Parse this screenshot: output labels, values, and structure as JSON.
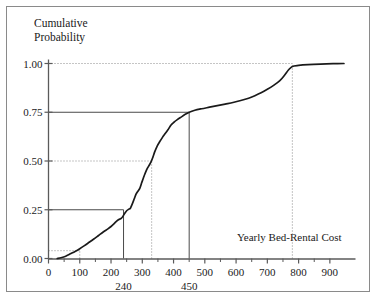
{
  "chart_data": {
    "type": "line",
    "title": "",
    "ylabel": "Cumulative\nProbability",
    "ylabel_line1": "Cumulative",
    "ylabel_line2": "Probability",
    "xlabel": "Yearly Bed-Rental Cost",
    "xlim": [
      0,
      950
    ],
    "ylim": [
      0.0,
      1.0
    ],
    "grid": false,
    "legend": null,
    "y_ticks": [
      {
        "value": 1.0,
        "label": "1.00"
      },
      {
        "value": 0.75,
        "label": "0.75"
      },
      {
        "value": 0.5,
        "label": "0.50"
      },
      {
        "value": 0.25,
        "label": "0.25"
      },
      {
        "value": 0.0,
        "label": "0.00"
      }
    ],
    "x_ticks": [
      {
        "value": 0,
        "label": "0"
      },
      {
        "value": 100,
        "label": "100"
      },
      {
        "value": 200,
        "label": "200"
      },
      {
        "value": 300,
        "label": "300"
      },
      {
        "value": 400,
        "label": "400"
      },
      {
        "value": 500,
        "label": "500"
      },
      {
        "value": 600,
        "label": "600"
      },
      {
        "value": 700,
        "label": "700"
      },
      {
        "value": 800,
        "label": "800"
      },
      {
        "value": 900,
        "label": "900"
      }
    ],
    "x_minor_ticks": [
      50,
      150,
      250,
      350,
      450,
      550,
      650,
      750,
      850
    ],
    "x_annotations": [
      {
        "value": 240,
        "label": "240"
      },
      {
        "value": 450,
        "label": "450"
      }
    ],
    "reference_lines": [
      {
        "name": "p25",
        "x": 240,
        "y": 0.25,
        "style": "solid",
        "color": "#4a4a4a"
      },
      {
        "name": "p50",
        "x": 330,
        "y": 0.5,
        "style": "dotted",
        "color": "#8a8a8a"
      },
      {
        "name": "p75",
        "x": 450,
        "y": 0.75,
        "style": "solid",
        "color": "#4a4a4a"
      },
      {
        "name": "p100",
        "x": 780,
        "y": 1.0,
        "style": "dotted",
        "color": "#8a8a8a"
      },
      {
        "name": "p_min",
        "x": 100,
        "y": 0.04,
        "style": "dotted",
        "color": "#8a8a8a"
      }
    ],
    "curve_color": "#1a1a1a",
    "axis_color": "#5a5a5a",
    "points": [
      {
        "x": 28,
        "y": 0.0
      },
      {
        "x": 40,
        "y": 0.004
      },
      {
        "x": 55,
        "y": 0.012
      },
      {
        "x": 70,
        "y": 0.024
      },
      {
        "x": 85,
        "y": 0.036
      },
      {
        "x": 100,
        "y": 0.05
      },
      {
        "x": 115,
        "y": 0.066
      },
      {
        "x": 130,
        "y": 0.083
      },
      {
        "x": 145,
        "y": 0.1
      },
      {
        "x": 160,
        "y": 0.118
      },
      {
        "x": 175,
        "y": 0.136
      },
      {
        "x": 190,
        "y": 0.152
      },
      {
        "x": 200,
        "y": 0.164
      },
      {
        "x": 210,
        "y": 0.179
      },
      {
        "x": 218,
        "y": 0.192
      },
      {
        "x": 225,
        "y": 0.2
      },
      {
        "x": 232,
        "y": 0.205
      },
      {
        "x": 238,
        "y": 0.216
      },
      {
        "x": 244,
        "y": 0.232
      },
      {
        "x": 250,
        "y": 0.245
      },
      {
        "x": 256,
        "y": 0.252
      },
      {
        "x": 262,
        "y": 0.258
      },
      {
        "x": 268,
        "y": 0.28
      },
      {
        "x": 274,
        "y": 0.305
      },
      {
        "x": 280,
        "y": 0.33
      },
      {
        "x": 286,
        "y": 0.345
      },
      {
        "x": 292,
        "y": 0.36
      },
      {
        "x": 298,
        "y": 0.388
      },
      {
        "x": 304,
        "y": 0.415
      },
      {
        "x": 310,
        "y": 0.44
      },
      {
        "x": 316,
        "y": 0.462
      },
      {
        "x": 322,
        "y": 0.478
      },
      {
        "x": 328,
        "y": 0.495
      },
      {
        "x": 334,
        "y": 0.52
      },
      {
        "x": 340,
        "y": 0.548
      },
      {
        "x": 348,
        "y": 0.578
      },
      {
        "x": 356,
        "y": 0.6
      },
      {
        "x": 364,
        "y": 0.62
      },
      {
        "x": 372,
        "y": 0.638
      },
      {
        "x": 382,
        "y": 0.66
      },
      {
        "x": 392,
        "y": 0.685
      },
      {
        "x": 402,
        "y": 0.7
      },
      {
        "x": 412,
        "y": 0.712
      },
      {
        "x": 424,
        "y": 0.725
      },
      {
        "x": 436,
        "y": 0.738
      },
      {
        "x": 450,
        "y": 0.75
      },
      {
        "x": 468,
        "y": 0.76
      },
      {
        "x": 490,
        "y": 0.768
      },
      {
        "x": 515,
        "y": 0.776
      },
      {
        "x": 540,
        "y": 0.784
      },
      {
        "x": 565,
        "y": 0.792
      },
      {
        "x": 590,
        "y": 0.8
      },
      {
        "x": 615,
        "y": 0.81
      },
      {
        "x": 640,
        "y": 0.822
      },
      {
        "x": 660,
        "y": 0.835
      },
      {
        "x": 680,
        "y": 0.85
      },
      {
        "x": 700,
        "y": 0.868
      },
      {
        "x": 720,
        "y": 0.888
      },
      {
        "x": 740,
        "y": 0.912
      },
      {
        "x": 755,
        "y": 0.94
      },
      {
        "x": 768,
        "y": 0.968
      },
      {
        "x": 780,
        "y": 0.985
      },
      {
        "x": 800,
        "y": 0.99
      },
      {
        "x": 830,
        "y": 0.994
      },
      {
        "x": 870,
        "y": 0.997
      },
      {
        "x": 910,
        "y": 0.999
      },
      {
        "x": 945,
        "y": 1.0
      }
    ]
  }
}
